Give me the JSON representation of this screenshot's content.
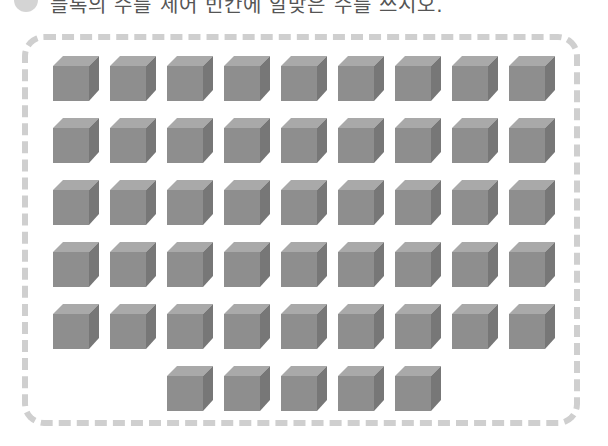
{
  "question": {
    "number_badge": "",
    "text": "블록의 수를 세어 빈칸에 알맞은 수를 쓰시오."
  },
  "blocks": {
    "total": 50,
    "rows": [
      {
        "count": 9,
        "start_col": 0
      },
      {
        "count": 9,
        "start_col": 0
      },
      {
        "count": 9,
        "start_col": 0
      },
      {
        "count": 9,
        "start_col": 0
      },
      {
        "count": 9,
        "start_col": 0
      },
      {
        "count": 5,
        "start_col": 2
      }
    ],
    "colors": {
      "front": "#8e8e8e",
      "top": "#a9a9a9",
      "side": "#777777"
    }
  },
  "frame": {
    "border_color": "#cfcfcf"
  }
}
